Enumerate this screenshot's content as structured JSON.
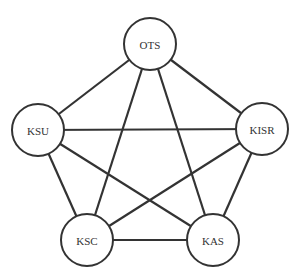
{
  "diagram": {
    "type": "complete-graph",
    "stroke_color": "#333333",
    "fill_color": "#ffffff",
    "node_radius": 26,
    "nodes": [
      {
        "id": "OTS",
        "label": "OTS",
        "x": 150,
        "y": 44
      },
      {
        "id": "KSU",
        "label": "KSU",
        "x": 38,
        "y": 130
      },
      {
        "id": "KISR",
        "label": "KISR",
        "x": 262,
        "y": 129
      },
      {
        "id": "KSC",
        "label": "KSC",
        "x": 87,
        "y": 240
      },
      {
        "id": "KAS",
        "label": "KAS",
        "x": 213,
        "y": 240
      }
    ],
    "edges": [
      [
        "OTS",
        "KSU"
      ],
      [
        "OTS",
        "KISR"
      ],
      [
        "OTS",
        "KSC"
      ],
      [
        "OTS",
        "KAS"
      ],
      [
        "KSU",
        "KISR"
      ],
      [
        "KSU",
        "KSC"
      ],
      [
        "KSU",
        "KAS"
      ],
      [
        "KISR",
        "KSC"
      ],
      [
        "KISR",
        "KAS"
      ],
      [
        "KSC",
        "KAS"
      ]
    ]
  }
}
